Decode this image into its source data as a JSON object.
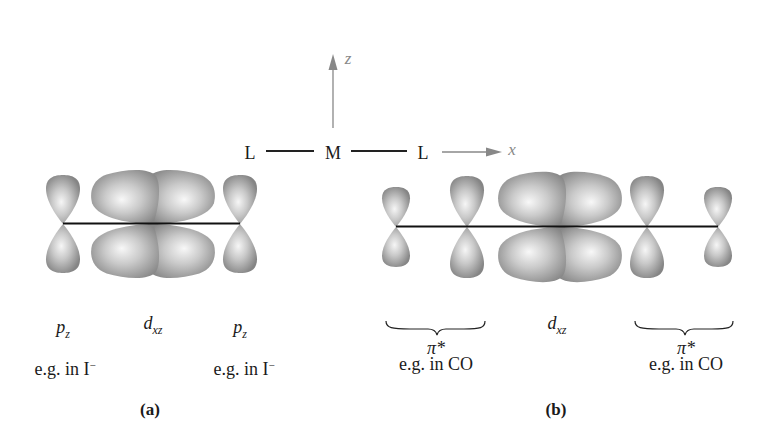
{
  "axes_diagram": {
    "left_ligand": "L",
    "metal": "M",
    "right_ligand": "L",
    "x_axis_label": "x",
    "z_axis_label": "z",
    "axis_color": "#888888"
  },
  "panel_a": {
    "caption": "(a)",
    "orbitals": [
      {
        "symbol": "p",
        "subscript": "z",
        "note": "e.g. in I",
        "note_superscript": "−"
      },
      {
        "symbol": "d",
        "subscript": "xz"
      },
      {
        "symbol": "p",
        "subscript": "z",
        "note": "e.g. in I",
        "note_superscript": "−"
      }
    ]
  },
  "panel_b": {
    "caption": "(b)",
    "left_group": {
      "symbol": "π*",
      "note": "e.g. in CO"
    },
    "center": {
      "symbol": "d",
      "subscript": "xz"
    },
    "right_group": {
      "symbol": "π*",
      "note": "e.g. in CO"
    }
  },
  "colors": {
    "lobe_light": "#f4f4f4",
    "lobe_dark": "#8a8a8a",
    "bond_line": "#111111"
  }
}
